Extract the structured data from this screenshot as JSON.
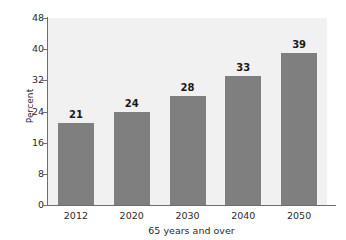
{
  "chart_data": {
    "type": "bar",
    "title": "",
    "subtitle": "",
    "xlabel": "65 years and over",
    "ylabel": "Percent",
    "categories": [
      "2012",
      "2020",
      "2030",
      "2040",
      "2050"
    ],
    "values": [
      21,
      24,
      28,
      33,
      39
    ],
    "data_labels": [
      "21",
      "24",
      "28",
      "33",
      "39"
    ],
    "ylim": [
      0,
      48
    ],
    "yticks": [
      0,
      8,
      16,
      24,
      32,
      40,
      48
    ],
    "ytick_labels": [
      "0",
      "8",
      "16",
      "24",
      "32",
      "40",
      "48"
    ],
    "grid": false,
    "legend": false,
    "legend_position": "none",
    "series": [
      {
        "name": "Percent 65 years and over",
        "values": [
          21,
          24,
          28,
          33,
          39
        ]
      }
    ],
    "colors": {
      "bar_fill": "#7f7f7f",
      "plot_background": "#f1f1f1",
      "figure_background": "#ffffff",
      "axis_line": "#6e6e6e",
      "label_text": "#2b2b2b",
      "value_text": "#1a1a1a"
    }
  }
}
